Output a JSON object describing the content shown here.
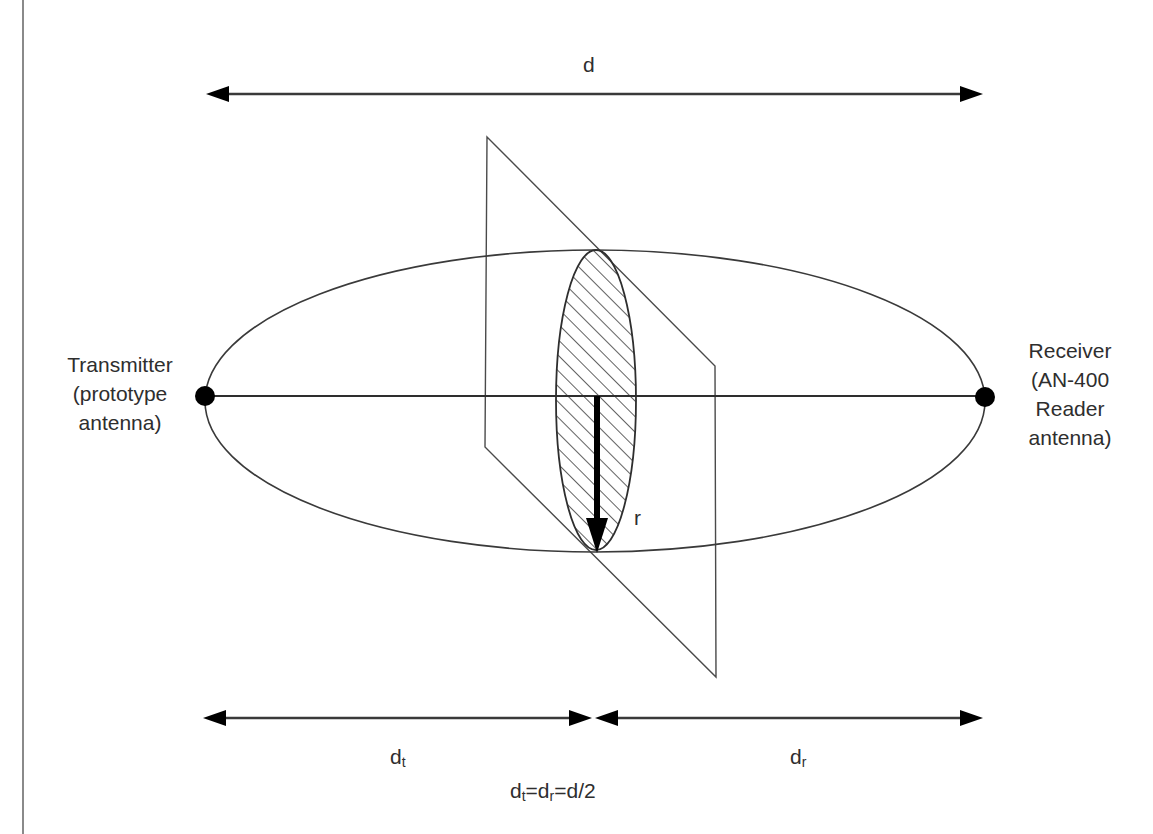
{
  "diagram": {
    "title_distance_label": "d",
    "transmitter": {
      "lines": [
        "Transmitter",
        "(prototype",
        "antenna)"
      ]
    },
    "receiver": {
      "lines": [
        "Receiver",
        "(AN-400",
        "Reader",
        "antenna)"
      ]
    },
    "radius_label": "r",
    "segment_labels": {
      "dt_main": "d",
      "dt_sub": "t",
      "dr_main": "d",
      "dr_sub": "r"
    },
    "equation": {
      "part1_main": "d",
      "part1_sub": "t",
      "eq1": "=",
      "part2_main": "d",
      "part2_sub": "r",
      "eq2": "=d/2"
    },
    "elements": {
      "ellipse": "first Fresnel zone ellipsoid",
      "plane": "cross-section plane at midpoint",
      "hatched_region": "Fresnel zone cross-section",
      "arrow_radius": "radius r"
    },
    "colors": {
      "line": "#3a3a3a",
      "arrow": "#000000",
      "text": "#2e2e2e",
      "border": "#8a8a8a",
      "background": "#ffffff"
    }
  }
}
